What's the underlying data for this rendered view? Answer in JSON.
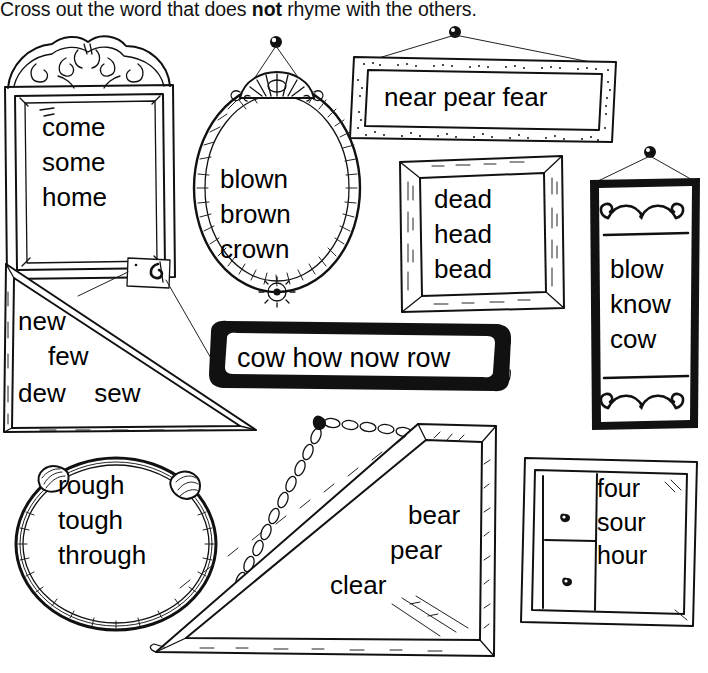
{
  "worksheet": {
    "instruction_prefix": "Cross out the word that does ",
    "instruction_emphasis": "not",
    "instruction_suffix": " rhyme with the others.",
    "ink_color": "#111111",
    "paper_color": "#ffffff"
  },
  "frames": [
    {
      "id": "ornate-frame",
      "style_name": "ornate-crested-rectangle",
      "words": [
        "come",
        "some",
        "home"
      ],
      "layout": "stacked"
    },
    {
      "id": "oval-mirror",
      "style_name": "hanging-oval-mirror",
      "words": [
        "blown",
        "brown",
        "crown"
      ],
      "layout": "stacked"
    },
    {
      "id": "speckled-banner",
      "style_name": "wide-stippled-frame-on-wire",
      "words": [
        "near",
        "pear",
        "fear"
      ],
      "layout": "inline"
    },
    {
      "id": "wood-frame",
      "style_name": "beveled-wood-rectangle",
      "words": [
        "dead",
        "head",
        "bead"
      ],
      "layout": "stacked"
    },
    {
      "id": "tall-plaque",
      "style_name": "tall-black-plaque-with-scrolls",
      "words": [
        "blow",
        "know",
        "cow"
      ],
      "layout": "stacked"
    },
    {
      "id": "triangle-left",
      "style_name": "triangle-frame-on-hook",
      "words": [
        "new",
        "few",
        "dew",
        "sew"
      ],
      "layout": "triangle-left"
    },
    {
      "id": "black-bar",
      "style_name": "thick-black-rounded-bar",
      "words": [
        "cow",
        "how",
        "now",
        "row"
      ],
      "layout": "inline"
    },
    {
      "id": "round-wreath",
      "style_name": "round-rope-wreath",
      "words": [
        "rough",
        "tough",
        "through"
      ],
      "layout": "stacked"
    },
    {
      "id": "triangle-right",
      "style_name": "triangle-frame-on-chain",
      "words": [
        "bear",
        "pear",
        "clear"
      ],
      "layout": "triangle-right"
    },
    {
      "id": "window-frame",
      "style_name": "paned-window-frame",
      "words": [
        "four",
        "sour",
        "hour"
      ],
      "layout": "stacked"
    }
  ]
}
